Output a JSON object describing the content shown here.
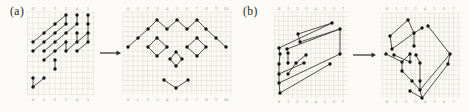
{
  "figure": {
    "background": "#fbfaf6",
    "colors": {
      "grid": "#ddd8cc",
      "edge": "#3d3d3d",
      "dot": "#141414",
      "tick": "#a19d92",
      "panel_label": "#1f1f1f",
      "arrow": "#2a2a2a"
    },
    "panels": [
      {
        "label": "(a)",
        "label_x": 10,
        "label_y": 5,
        "arrow": {
          "x1": 100,
          "x2": 121,
          "y": 53
        },
        "diagrams": [
          {
            "name": "a-left",
            "grid": {
              "x0": 27.5,
              "x1": 93.5,
              "y0": 12,
              "y1": 95,
              "cell": 5.5
            },
            "ticks": {
              "labels": [
                "0",
                "1",
                "2",
                "3",
                "4",
                "5"
              ],
              "x0": 33,
              "dx": 11,
              "y_top": 10,
              "y_bottom": 101
            },
            "points": [
              [
                66,
                15
              ],
              [
                77,
                15
              ],
              [
                88,
                15
              ],
              [
                55,
                24
              ],
              [
                66,
                24
              ],
              [
                77,
                24
              ],
              [
                88,
                24
              ],
              [
                44,
                33
              ],
              [
                55,
                33
              ],
              [
                66,
                33
              ],
              [
                77,
                33
              ],
              [
                88,
                33
              ],
              [
                33,
                42
              ],
              [
                44,
                42
              ],
              [
                55,
                42
              ],
              [
                66,
                42
              ],
              [
                77,
                42
              ],
              [
                88,
                42
              ],
              [
                33,
                51
              ],
              [
                44,
                51
              ],
              [
                55,
                51
              ],
              [
                66,
                51
              ],
              [
                77,
                51
              ],
              [
                44,
                60
              ],
              [
                55,
                60
              ],
              [
                55,
                69
              ],
              [
                33,
                78
              ],
              [
                44,
                78
              ],
              [
                33,
                87
              ]
            ],
            "edges": [
              [
                0,
                4
              ],
              [
                1,
                5
              ],
              [
                2,
                6
              ],
              [
                6,
                11
              ],
              [
                10,
                16
              ],
              [
                15,
                21
              ],
              [
                11,
                17
              ],
              [
                24,
                25
              ],
              [
                26,
                28
              ],
              [
                3,
                0
              ],
              [
                7,
                3
              ],
              [
                12,
                7
              ],
              [
                8,
                4
              ],
              [
                13,
                8
              ],
              [
                14,
                9
              ],
              [
                9,
                5
              ],
              [
                18,
                13
              ],
              [
                19,
                14
              ],
              [
                20,
                15
              ],
              [
                21,
                16
              ],
              [
                22,
                17
              ],
              [
                16,
                11
              ],
              [
                23,
                20
              ],
              [
                28,
                27
              ]
            ]
          },
          {
            "name": "a-right",
            "grid": {
              "x0": 123.1,
              "x1": 230.9,
              "y0": 12,
              "y1": 95,
              "cell": 4.9
            },
            "ticks": {
              "labels": [
                "0",
                "1",
                "2",
                "3",
                "4",
                "5",
                "6",
                "7",
                "8",
                "9",
                "10"
              ],
              "x0": 128,
              "dx": 9.8,
              "y_top": 10,
              "y_bottom": 101
            },
            "points": [
              [
                128,
                47
              ],
              [
                138,
                38
              ],
              [
                148,
                29
              ],
              [
                157,
                20
              ],
              [
                167,
                29
              ],
              [
                177,
                20
              ],
              [
                187,
                29
              ],
              [
                197,
                20
              ],
              [
                206,
                29
              ],
              [
                216,
                38
              ],
              [
                226,
                47
              ],
              [
                148,
                47
              ],
              [
                157,
                38
              ],
              [
                167,
                47
              ],
              [
                157,
                56
              ],
              [
                187,
                47
              ],
              [
                197,
                38
              ],
              [
                206,
                47
              ],
              [
                197,
                56
              ],
              [
                176,
                52
              ],
              [
                170,
                59
              ],
              [
                182,
                59
              ],
              [
                176,
                66
              ],
              [
                164,
                80
              ],
              [
                176,
                88
              ],
              [
                188,
                80
              ]
            ],
            "edges": [
              [
                0,
                1
              ],
              [
                1,
                2
              ],
              [
                2,
                3
              ],
              [
                3,
                4
              ],
              [
                4,
                5
              ],
              [
                5,
                6
              ],
              [
                6,
                7
              ],
              [
                7,
                8
              ],
              [
                8,
                9
              ],
              [
                9,
                10
              ],
              [
                11,
                12
              ],
              [
                12,
                13
              ],
              [
                13,
                14
              ],
              [
                14,
                11
              ],
              [
                15,
                16
              ],
              [
                16,
                17
              ],
              [
                17,
                18
              ],
              [
                18,
                15
              ],
              [
                19,
                20
              ],
              [
                19,
                21
              ],
              [
                20,
                22
              ],
              [
                21,
                22
              ],
              [
                23,
                24
              ],
              [
                24,
                25
              ]
            ]
          }
        ]
      },
      {
        "label": "(b)",
        "label_x": 243,
        "label_y": 5,
        "arrow": {
          "x1": 353,
          "x2": 376,
          "y": 55
        },
        "diagrams": [
          {
            "name": "b-left",
            "grid": {
              "x0": 274.4,
              "x1": 347.6,
              "y0": 12,
              "y1": 98,
              "cell": 4.58
            },
            "ticks": {
              "labels": [
                "0",
                "1",
                "2",
                "3",
                "4",
                "5",
                "6",
                "7"
              ],
              "x0": 279,
              "dx": 9.15,
              "y_top": 10,
              "y_bottom": 103
            },
            "points": [
              [
                332,
                23
              ],
              [
                340,
                29
              ],
              [
                340,
                54
              ],
              [
                330,
                64
              ],
              [
                298,
                34
              ],
              [
                300,
                42
              ],
              [
                279,
                48
              ],
              [
                287,
                49
              ],
              [
                280,
                54
              ],
              [
                288,
                53
              ],
              [
                306,
                55
              ],
              [
                279,
                64
              ],
              [
                288,
                63
              ],
              [
                296,
                63
              ],
              [
                304,
                63
              ],
              [
                279,
                74
              ],
              [
                288,
                74
              ],
              [
                279,
                83
              ],
              [
                280,
                93
              ]
            ],
            "edges": [
              [
                6,
                0
              ],
              [
                7,
                1
              ],
              [
                4,
                0
              ],
              [
                5,
                1
              ],
              [
                4,
                5
              ],
              [
                1,
                2
              ],
              [
                18,
                3
              ],
              [
                17,
                2
              ],
              [
                15,
                14
              ],
              [
                6,
                8
              ],
              [
                8,
                11
              ],
              [
                11,
                15
              ],
              [
                15,
                17
              ],
              [
                17,
                18
              ],
              [
                9,
                12
              ],
              [
                13,
                10
              ],
              [
                16,
                13
              ]
            ]
          },
          {
            "name": "b-right",
            "grid": {
              "x0": 382.25,
              "x1": 460.5,
              "y0": 13,
              "y1": 98,
              "cell": 4.75
            },
            "ticks": {
              "labels": [
                "0",
                "1",
                "2",
                "3",
                "4",
                "5",
                "6",
                "7"
              ],
              "x0": 387,
              "dx": 9.5,
              "y_top": 10,
              "y_bottom": 103
            },
            "points": [
              [
                408,
                20
              ],
              [
                390,
                36
              ],
              [
                414,
                33
              ],
              [
                392,
                49
              ],
              [
                414,
                46
              ],
              [
                422,
                28
              ],
              [
                428,
                26
              ],
              [
                450,
                54
              ],
              [
                448,
                64
              ],
              [
                386,
                54
              ],
              [
                394,
                55
              ],
              [
                410,
                54
              ],
              [
                416,
                55
              ],
              [
                402,
                62
              ],
              [
                410,
                62
              ],
              [
                420,
                63
              ],
              [
                402,
                71
              ],
              [
                412,
                81
              ],
              [
                420,
                81
              ],
              [
                410,
                91
              ],
              [
                420,
                90
              ],
              [
                422,
                98
              ]
            ],
            "edges": [
              [
                0,
                1
              ],
              [
                1,
                3
              ],
              [
                3,
                2
              ],
              [
                2,
                0
              ],
              [
                2,
                4
              ],
              [
                5,
                2
              ],
              [
                6,
                7
              ],
              [
                7,
                8
              ],
              [
                7,
                20
              ],
              [
                8,
                21
              ],
              [
                9,
                13
              ],
              [
                10,
                14
              ],
              [
                11,
                13
              ],
              [
                12,
                15
              ],
              [
                13,
                16
              ],
              [
                16,
                17
              ],
              [
                15,
                18
              ],
              [
                17,
                20
              ],
              [
                18,
                20
              ],
              [
                19,
                21
              ],
              [
                20,
                21
              ],
              [
                11,
                14
              ]
            ]
          }
        ]
      }
    ]
  }
}
